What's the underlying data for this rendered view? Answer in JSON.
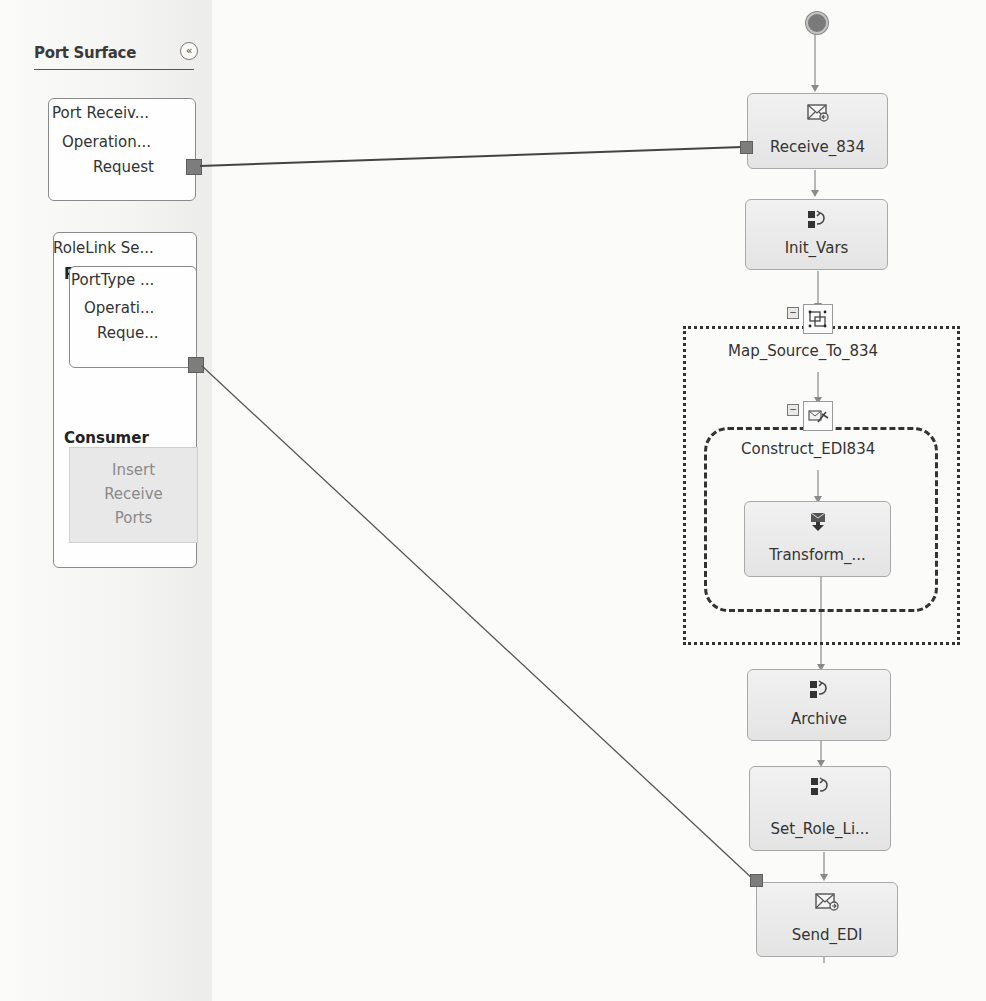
{
  "port_surface": {
    "title": "Port Surface",
    "collapse_glyph": "«",
    "ports": [
      {
        "name": "Port Receiv...",
        "operation": "Operation...",
        "message": "Request"
      },
      {
        "name": "RoleLink Se...",
        "provider_label": "Provider",
        "port_type": "PortType ...",
        "operation": "Operati...",
        "message": "Reque...",
        "consumer_label": "Consumer",
        "insert_lines": [
          "Insert",
          "Receive",
          "Ports"
        ]
      }
    ]
  },
  "orchestration": {
    "shapes": [
      {
        "id": "receive",
        "label": "Receive_834",
        "icon": "receive-message-icon"
      },
      {
        "id": "init",
        "label": "Init_Vars",
        "icon": "expression-icon"
      },
      {
        "id": "scope",
        "label": "Map_Source_To_834",
        "icon": "scope-icon"
      },
      {
        "id": "construct",
        "label": "Construct_EDI834",
        "icon": "construct-message-icon"
      },
      {
        "id": "transform",
        "label": "Transform_...",
        "icon": "transform-icon"
      },
      {
        "id": "archive",
        "label": "Archive",
        "icon": "expression-icon"
      },
      {
        "id": "setrole",
        "label": "Set_Role_Li...",
        "icon": "expression-icon"
      },
      {
        "id": "send",
        "label": "Send_EDI",
        "icon": "send-message-icon"
      }
    ],
    "collapse_glyph": "−"
  },
  "colors": {
    "connector": "#7d7d7d",
    "shape_fill": "#e8e8e8",
    "line": "#555555"
  }
}
